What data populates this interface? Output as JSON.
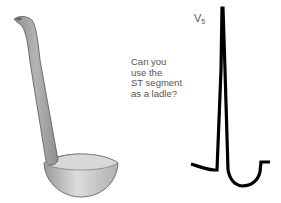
{
  "caption": {
    "lines": [
      "Can you",
      "use the",
      "ST segment",
      "as a ladle?"
    ]
  },
  "ecg": {
    "lead_label": "V",
    "lead_subscript": "5",
    "trace_color": "#000000"
  },
  "ladle": {
    "body_color": "#a9a9a9",
    "bowl_color": "#c8c8c8",
    "outline_color": "#555555"
  }
}
